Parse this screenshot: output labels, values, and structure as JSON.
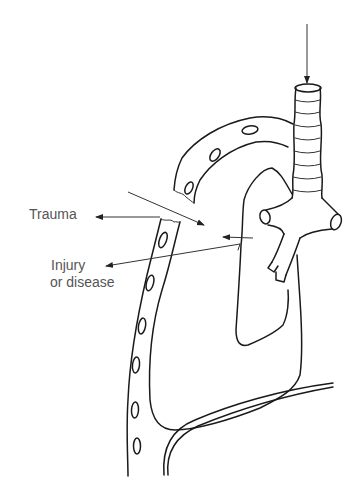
{
  "diagram": {
    "labels": {
      "trauma": "Trauma",
      "injury_line1": "Injury",
      "injury_line2": "or disease"
    },
    "parts": [
      "trachea",
      "bronchi",
      "lung",
      "chest-wall-ribs",
      "diaphragm"
    ],
    "arrows": [
      {
        "name": "air-in-arrow",
        "direction": "down",
        "target": "trachea"
      },
      {
        "name": "trauma-arrow",
        "direction": "left",
        "target": "trauma-label"
      },
      {
        "name": "injury-arrow",
        "direction": "left",
        "target": "injury-label"
      },
      {
        "name": "air-leak-arrow-1",
        "direction": "down-right",
        "target": "pleural-space"
      },
      {
        "name": "air-leak-arrow-2",
        "direction": "left",
        "target": "pleural-space"
      }
    ],
    "colors": {
      "line": "#1a1a1a",
      "label_text": "#555555",
      "background": "#ffffff"
    }
  }
}
